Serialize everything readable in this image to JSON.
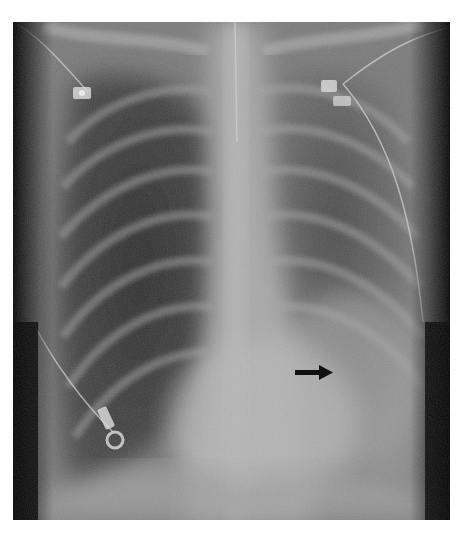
{
  "figure": {
    "type": "chest-xray",
    "view": "frontal",
    "annotations": [
      {
        "kind": "arrow",
        "direction": "right",
        "color": "#111111"
      }
    ],
    "devices": [
      "ecg-electrode-left-upper",
      "ecg-electrode-right-upper",
      "ecg-electrode-right-lower",
      "central-line",
      "ecg-leads"
    ]
  },
  "caption": {
    "text": "",
    "clipped": true
  },
  "colors": {
    "background": "#ffffff",
    "lung_dark": "#3a3a3a",
    "soft_tissue": "#8a8a8a",
    "mediastinum": "#b5b5b5",
    "body_edge": "#0a0a0a"
  }
}
